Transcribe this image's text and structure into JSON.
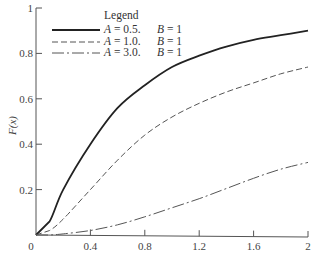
{
  "chart_data": {
    "type": "line",
    "title": "",
    "xlabel": "",
    "ylabel": "F(x)",
    "xlim": [
      0,
      2
    ],
    "ylim": [
      0,
      1
    ],
    "grid": false,
    "legend_position": "upper-left",
    "legend_title": "Legend",
    "x_ticks": [
      "0",
      "0.4",
      "0.8",
      "1.2",
      "1.6",
      "2"
    ],
    "y_ticks": [
      "0.2",
      "0.4",
      "0.6",
      "0.8",
      "1"
    ],
    "x": [
      0,
      0.1,
      0.2,
      0.4,
      0.6,
      0.8,
      1.0,
      1.2,
      1.4,
      1.6,
      1.8,
      2.0
    ],
    "series": [
      {
        "name": "A = 0.5.  B = 1",
        "A": "0.5.",
        "B": "1",
        "style": "solid",
        "values": [
          0,
          0.06,
          0.2,
          0.4,
          0.56,
          0.66,
          0.74,
          0.79,
          0.83,
          0.86,
          0.88,
          0.9
        ]
      },
      {
        "name": "A = 1.0.  B = 1",
        "A": "1.0.",
        "B": "1",
        "style": "dashed",
        "values": [
          0,
          0.02,
          0.07,
          0.2,
          0.33,
          0.44,
          0.52,
          0.58,
          0.63,
          0.67,
          0.71,
          0.74
        ]
      },
      {
        "name": "A = 3.0.  B = 1",
        "A": "3.0.",
        "B": "1",
        "style": "dash-dot",
        "values": [
          0,
          0.0,
          0.005,
          0.02,
          0.045,
          0.08,
          0.12,
          0.16,
          0.205,
          0.25,
          0.29,
          0.32
        ]
      }
    ]
  },
  "axis": {
    "origin_label": "0",
    "ylabel_text": "F(x)"
  },
  "legend": {
    "title": "Legend",
    "entries": [
      {
        "a_label": "A",
        "eq": " = 0.5.",
        "b_label": "B",
        "b_eq": " = 1"
      },
      {
        "a_label": "A",
        "eq": " = 1.0.",
        "b_label": "B",
        "b_eq": " = 1"
      },
      {
        "a_label": "A",
        "eq": " = 3.0.",
        "b_label": "B",
        "b_eq": " = 1"
      }
    ]
  }
}
